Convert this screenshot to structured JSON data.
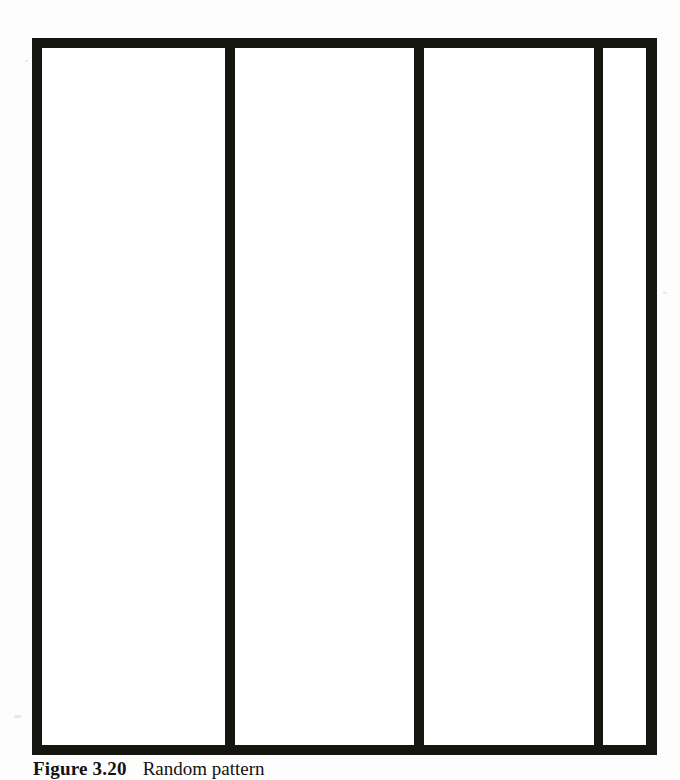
{
  "figure": {
    "caption_label": "Figure 3.20",
    "caption_text": "Random pattern",
    "frame_name": "figure-frame",
    "border_color": "#17150f",
    "panel_fill": "#ffffff",
    "page_background": "#fdfdfd",
    "panels": [
      {
        "id": "panel-1",
        "label": "",
        "width_px": 186,
        "kind": "wide"
      },
      {
        "id": "panel-2",
        "label": "",
        "width_px": 182,
        "kind": "wide"
      },
      {
        "id": "panel-3",
        "label": "",
        "width_px": 173,
        "kind": "wide"
      },
      {
        "id": "panel-4",
        "label": "",
        "width_px": 44,
        "kind": "narrow"
      }
    ],
    "rules": [
      {
        "id": "rule-1",
        "orientation": "vertical",
        "x_px": 218,
        "thickness_px": 10
      },
      {
        "id": "rule-2",
        "orientation": "vertical",
        "x_px": 410,
        "thickness_px": 10
      },
      {
        "id": "rule-3",
        "orientation": "vertical",
        "x_px": 593,
        "thickness_px": 9
      }
    ],
    "frame_bounds": {
      "left_px": 32,
      "top_px": 38,
      "right_px": 657,
      "bottom_px": 755
    }
  }
}
